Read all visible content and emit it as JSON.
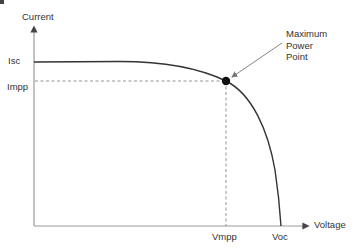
{
  "diagram": {
    "axes": {
      "y_label": "Current",
      "x_label": "Voltage"
    },
    "y_ticks": {
      "isc": "Isc",
      "impp": "Impp"
    },
    "x_ticks": {
      "vmpp": "Vmpp",
      "voc": "Voc"
    },
    "annotation": {
      "line1": "Maximum",
      "line2": "Power",
      "line3": "Point"
    },
    "colors": {
      "curve": "#333333",
      "axis": "#888888",
      "dashed": "#888888",
      "point": "#111111",
      "text": "#333333"
    }
  }
}
